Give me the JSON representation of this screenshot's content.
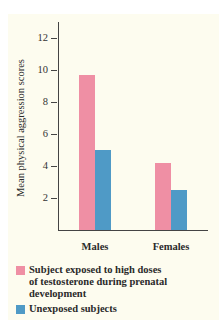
{
  "chart_data": {
    "type": "bar",
    "title": "",
    "xlabel": "",
    "ylabel": "Mean physical aggression scores",
    "categories": [
      "Males",
      "Females"
    ],
    "series": [
      {
        "name": "Subject exposed to high doses of testosterone during prenatal development",
        "color": "#ef8fa4",
        "values": [
          9.7,
          4.2
        ]
      },
      {
        "name": "Unexposed subjects",
        "color": "#4f9ac6",
        "values": [
          5.0,
          2.5
        ]
      }
    ],
    "yticks": [
      "2",
      "4",
      "6",
      "8",
      "10",
      "12"
    ],
    "ylim": [
      0,
      13
    ],
    "grid": false,
    "legend_position": "bottom"
  },
  "legend": {
    "items": [
      {
        "label_lines": [
          "Subject exposed to high doses",
          "of testosterone during prenatal",
          "development"
        ],
        "color": "#ef8fa4"
      },
      {
        "label_lines": [
          "Unexposed subjects"
        ],
        "color": "#4f9ac6"
      }
    ]
  }
}
